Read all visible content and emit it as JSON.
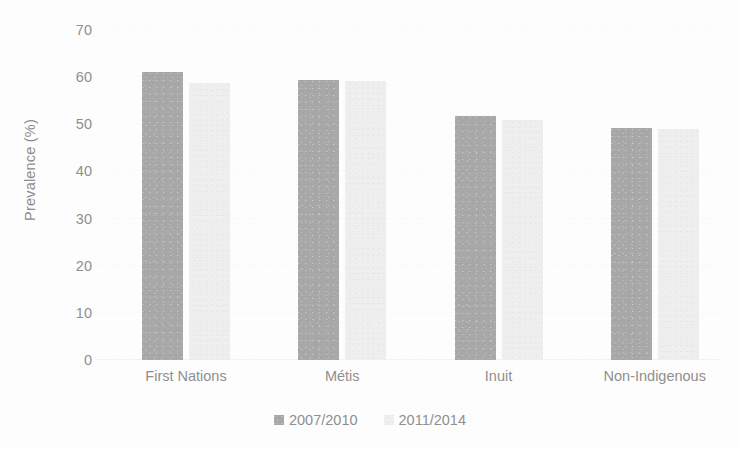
{
  "chart_data": {
    "type": "bar",
    "title": "",
    "xlabel": "",
    "ylabel": "Prevalence (%)",
    "ylim": [
      0,
      70
    ],
    "ytick_step": 10,
    "yticks": [
      70,
      60,
      50,
      40,
      30,
      20,
      10,
      0
    ],
    "grid": true,
    "legend_position": "bottom-center",
    "categories": [
      "First Nations",
      "Métis",
      "Inuit",
      "Non-Indigenous"
    ],
    "series": [
      {
        "name": "2007/2010",
        "color": "#a8a8a8",
        "values": [
          61.0,
          59.5,
          51.8,
          49.2
        ]
      },
      {
        "name": "2011/2014",
        "color": "#eeeeee",
        "values": [
          58.8,
          59.2,
          51.0,
          49.0
        ]
      }
    ]
  },
  "axes": {
    "y_title": "Prevalence (%)",
    "y_tick_labels": [
      "70",
      "60",
      "50",
      "40",
      "30",
      "20",
      "10",
      "0"
    ],
    "x_tick_labels": [
      "First Nations",
      "Métis",
      "Inuit",
      "Non-Indigenous"
    ]
  },
  "legend": {
    "entries": [
      {
        "label": "2007/2010",
        "color": "#a8a8a8"
      },
      {
        "label": "2011/2014",
        "color": "#eeeeee"
      }
    ]
  },
  "colors": {
    "series_2007_2010": "#a8a8a8",
    "series_2011_2014": "#eeeeee",
    "text": "#8f8f8f",
    "gridline": "#fafafa",
    "background": "#fdfdfd"
  }
}
